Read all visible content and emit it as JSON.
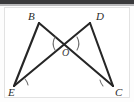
{
  "figure": {
    "background_color": "#ffffff",
    "card_border_color": "#e2e2e2",
    "top_band_color": "#3a3a3c",
    "stroke_color": "#262626",
    "arc_color": "#6f6f6f",
    "labels": {
      "b": "B",
      "d": "D",
      "e": "E",
      "c": "C",
      "o": "O"
    },
    "points": {
      "B": {
        "x": 39,
        "y": 23,
        "label_x": 28,
        "label_y": 20
      },
      "D": {
        "x": 90,
        "y": 23,
        "label_x": 96,
        "label_y": 20
      },
      "E": {
        "x": 14,
        "y": 86,
        "label_x": 8,
        "label_y": 96
      },
      "C": {
        "x": 113,
        "y": 86,
        "label_x": 115,
        "label_y": 96
      },
      "O": {
        "x": 66,
        "y": 43,
        "label_x": 62,
        "label_y": 56
      }
    },
    "segments": [
      {
        "name": "B-E",
        "from": "B",
        "to": "E"
      },
      {
        "name": "B-C",
        "from": "B",
        "to": "C"
      },
      {
        "name": "D-E",
        "from": "D",
        "to": "E"
      },
      {
        "name": "D-C",
        "from": "D",
        "to": "C"
      }
    ],
    "angle_marks": [
      {
        "name": "angle-at-E",
        "vertex": "E",
        "path": "M 25 79 A 13 13 0 0 1 28 85"
      },
      {
        "name": "angle-at-C",
        "vertex": "C",
        "path": "M 100 80 A 13 13 0 0 0 103 86"
      },
      {
        "name": "angle-at-O-left",
        "vertex": "O",
        "path": "M 55 37 A 13 13 0 0 0 55 50"
      },
      {
        "name": "angle-at-O-right",
        "vertex": "O",
        "path": "M 77 37 A 13 13 0 0 1 77 50"
      }
    ]
  }
}
